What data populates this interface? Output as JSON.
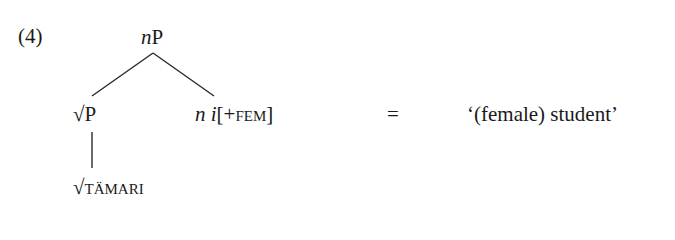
{
  "example": {
    "number": "(4)"
  },
  "tree": {
    "root": {
      "label_italic": "n",
      "label_rest": "P"
    },
    "left_child": {
      "label": "√P",
      "child": {
        "root_symbol": "√",
        "label": "TÄMARI"
      }
    },
    "right_child": {
      "head_italic": "n",
      "exponent_italic": "i",
      "feature_open": "[+",
      "feature": "FEM",
      "feature_close": "]"
    },
    "edges": [
      {
        "from": "nP",
        "to": "√P"
      },
      {
        "from": "nP",
        "to": "n i[+FEM]"
      },
      {
        "from": "√P",
        "to": "√TÄMARI"
      }
    ]
  },
  "equation": {
    "equals_sign": "=",
    "gloss": "‘(female) student’"
  }
}
